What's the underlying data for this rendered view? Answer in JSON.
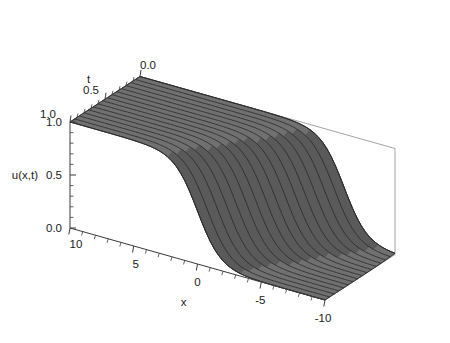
{
  "figure": {
    "kind": "3d-surface-plot",
    "background_color": "#ffffff",
    "surface_color": "#707070",
    "surface_color_dark": "#5a5a5a",
    "surface_color_light": "#8e8e8e",
    "mesh_line_color": "#2a2a2a",
    "axis_color": "#3a3a3a",
    "box_color": "#9a9a9a"
  },
  "axes": {
    "x": {
      "title": "x",
      "ticks": [
        "10",
        "5",
        "0",
        "-5",
        "-10"
      ],
      "tick_values": [
        10,
        5,
        0,
        -5,
        -10
      ],
      "range": [
        10,
        -10
      ],
      "minor_ticks_per_interval": 5
    },
    "t": {
      "title": "t",
      "ticks": [
        "0.0",
        "0.5",
        "1.0"
      ],
      "tick_values": [
        0.0,
        0.5,
        1.0
      ],
      "range": [
        0.0,
        1.0
      ],
      "minor_ticks_per_interval": 5
    },
    "u": {
      "title": "u(x,t)",
      "ticks": [
        "1.0",
        "0.5",
        "0.0"
      ],
      "tick_values": [
        1.0,
        0.5,
        0.0
      ],
      "range": [
        0.0,
        1.0
      ],
      "minor_ticks_per_interval": 5
    }
  },
  "chart_data": {
    "type": "surface",
    "title": "",
    "xlabel": "x",
    "ylabel": "t",
    "zlabel": "u(x,t)",
    "xlim": [
      -10,
      10
    ],
    "ylim": [
      0,
      1
    ],
    "zlim": [
      0,
      1
    ],
    "grid": false,
    "legend": "none",
    "model": {
      "formula": "u(x,t) = 1 / (1 + exp((x0 - x) / w + c * t))",
      "front_position_x0_at_t0": -6.0,
      "front_speed": 6.0,
      "front_width_w": 0.9,
      "front_positions": [
        {
          "t": 0.0,
          "x_front": -6.0
        },
        {
          "t": 0.25,
          "x_front": -4.5
        },
        {
          "t": 0.5,
          "x_front": -3.0
        },
        {
          "t": 0.75,
          "x_front": -1.5
        },
        {
          "t": 1.0,
          "x_front": 0.0
        }
      ]
    },
    "mesh": {
      "t_lines": 15,
      "x_samples": 61,
      "line_direction": "constant-t curves drawn along x"
    },
    "sampled_curves": [
      {
        "t": 0.0,
        "x": [
          10,
          6,
          2,
          0,
          -2,
          -4,
          -5,
          -6,
          -7,
          -8,
          -10
        ],
        "u": [
          1.0,
          1.0,
          1.0,
          0.999,
          0.988,
          0.905,
          0.75,
          0.5,
          0.25,
          0.095,
          0.012
        ]
      },
      {
        "t": 0.5,
        "x": [
          10,
          6,
          2,
          0,
          -1,
          -2,
          -3,
          -4,
          -5,
          -6,
          -10
        ],
        "u": [
          1.0,
          1.0,
          0.996,
          0.964,
          0.905,
          0.75,
          0.5,
          0.25,
          0.095,
          0.036,
          0.001
        ]
      },
      {
        "t": 1.0,
        "x": [
          10,
          6,
          4,
          3,
          2,
          1,
          0,
          -1,
          -2,
          -3,
          -10
        ],
        "u": [
          1.0,
          0.999,
          0.988,
          0.964,
          0.905,
          0.75,
          0.5,
          0.25,
          0.095,
          0.036,
          0.0
        ]
      }
    ]
  }
}
